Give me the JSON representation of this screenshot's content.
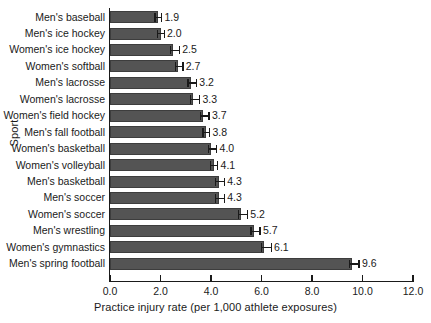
{
  "chart_data": {
    "type": "bar",
    "orientation": "horizontal",
    "title": "",
    "xlabel": "Practice injury rate (per 1,000 athlete exposures)",
    "ylabel": "Sport",
    "xlim": [
      0.0,
      12.0
    ],
    "xticks": [
      "0.0",
      "2.0",
      "4.0",
      "6.0",
      "8.0",
      "10.0",
      "12.0"
    ],
    "xtick_values": [
      0.0,
      2.0,
      4.0,
      6.0,
      8.0,
      10.0,
      12.0
    ],
    "grid": false,
    "legend": "none",
    "bar_color": "#545454",
    "error_bar_color": "#1a1a1a",
    "categories": [
      "Men's baseball",
      "Men's ice hockey",
      "Women's ice hockey",
      "Women's softball",
      "Men's lacrosse",
      "Women's lacrosse",
      "Women's field hockey",
      "Men's fall football",
      "Women's basketball",
      "Women's volleyball",
      "Men's basketball",
      "Men's soccer",
      "Women's soccer",
      "Men's wrestling",
      "Women's gymnastics",
      "Men's spring football"
    ],
    "values": [
      1.9,
      2.0,
      2.5,
      2.7,
      3.2,
      3.3,
      3.7,
      3.8,
      4.0,
      4.1,
      4.3,
      4.3,
      5.2,
      5.7,
      6.1,
      9.6
    ],
    "value_labels": [
      "1.9",
      "2.0",
      "2.5",
      "2.7",
      "3.2",
      "3.3",
      "3.7",
      "3.8",
      "4.0",
      "4.1",
      "4.3",
      "4.3",
      "5.2",
      "5.7",
      "6.1",
      "9.6"
    ],
    "errors": [
      0.12,
      0.12,
      0.22,
      0.16,
      0.2,
      0.22,
      0.2,
      0.12,
      0.2,
      0.14,
      0.2,
      0.2,
      0.22,
      0.22,
      0.26,
      0.24
    ]
  }
}
